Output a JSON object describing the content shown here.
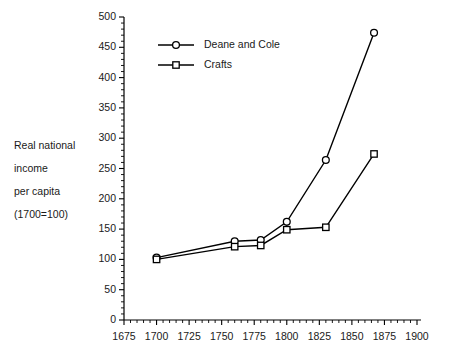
{
  "chart_data": {
    "type": "line",
    "title": "",
    "subtitle": "",
    "xlabel": "",
    "ylabel": "Real national\nincome\nper capita\n(1700=100)",
    "xlim": [
      1675,
      1900
    ],
    "ylim": [
      0,
      500
    ],
    "grid": false,
    "legend_position": "top-left-inside",
    "x_major_ticks": [
      1675,
      1700,
      1725,
      1750,
      1775,
      1800,
      1825,
      1850,
      1875,
      1900
    ],
    "x_tick_labels": [
      "1675",
      "1700",
      "1725",
      "1750",
      "1775",
      "1800",
      "1825",
      "1850",
      "1875",
      "1900"
    ],
    "x_minor_step": 5,
    "y_major_ticks": [
      0,
      50,
      100,
      150,
      200,
      250,
      300,
      350,
      400,
      450,
      500
    ],
    "y_tick_labels": [
      "0",
      "50",
      "100",
      "150",
      "200",
      "250",
      "300",
      "350",
      "400",
      "450",
      "500"
    ],
    "y_minor_step": 10,
    "series": [
      {
        "name": "Deane and Cole",
        "marker": "circle",
        "x": [
          1700,
          1760,
          1780,
          1800,
          1830,
          1867
        ],
        "values": [
          103,
          130,
          132,
          162,
          264,
          474
        ]
      },
      {
        "name": "Crafts",
        "marker": "square",
        "x": [
          1700,
          1760,
          1780,
          1800,
          1830,
          1867
        ],
        "values": [
          100,
          121,
          123,
          149,
          153,
          274
        ]
      }
    ],
    "colors": {
      "line": "#000000",
      "marker_fill": "#ffffff",
      "axis": "#000000",
      "text": "#1a1a1a",
      "background": "#ffffff"
    }
  },
  "legend": {
    "entries": [
      {
        "label": "Deane and Cole",
        "marker": "circle"
      },
      {
        "label": "Crafts",
        "marker": "square"
      }
    ]
  },
  "y_axis_caption": {
    "line1": "Real national",
    "line2": "income",
    "line3": "per capita",
    "line4": "(1700=100)"
  }
}
